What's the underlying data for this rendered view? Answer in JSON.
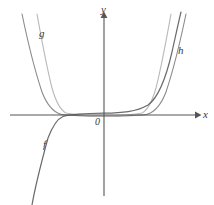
{
  "figure": {
    "background_color": "#ffffff",
    "width": 214,
    "height": 205
  },
  "axes": {
    "y_label": "y",
    "x_label": "x",
    "origin_label": "0",
    "origin_px": {
      "x": 104,
      "y": 115
    },
    "axis_color": "#555555",
    "x_axis": {
      "x_start": 10,
      "x_end": 197,
      "y": 115,
      "arrow": "right"
    },
    "y_axis": {
      "y_start": 16,
      "y_end": 196,
      "x": 104,
      "arrow": "up"
    }
  },
  "curves": [
    {
      "name": "f",
      "label": "f",
      "color": "#6b6b6b",
      "kind": "odd-power",
      "description": "odd power function, increasing through origin region, flattens near x-axis on the right and falls steeply to lower-left",
      "path": "M 32 205 C 36 182, 42 160, 48 138 C 53 125, 57 119, 63 116.5 C 72 114, 86 113.4, 104 113.2 C 122 113.0, 136 112.0, 148 105 C 158 98, 166 78, 172 52 C 176 34, 179 20, 181 12"
    },
    {
      "name": "g",
      "label": "g",
      "color": "#b9b9b9",
      "kind": "even-power-steep",
      "description": "even power function, symmetric U shape, steepest walls nearest the y-axis",
      "path": "M 37 14 C 41 36, 46 64, 52 88 C 56 102, 60 110, 66 113 C 76 115.2, 88 115.6, 104 115.7 C 120 115.6, 132 115.2, 142 113 C 148 110, 152 102, 156 88 C 162 64, 167 36, 171 14"
    },
    {
      "name": "h",
      "label": "h",
      "color": "#8a8a8a",
      "kind": "even-power-wide",
      "description": "even power function, symmetric U shape, wider than g",
      "path": "M 22 14 C 27 38, 34 68, 42 92 C 47 105, 53 112, 61 114.4 C 74 116, 90 116.2, 104 116.3 C 118 116.2, 134 116, 147 114.4 C 155 112, 161 105, 166 92 C 174 68, 181 38, 186 14"
    }
  ],
  "labels": {
    "f": "f",
    "g": "g",
    "h": "h",
    "x": "x",
    "y": "y",
    "origin": "0"
  }
}
